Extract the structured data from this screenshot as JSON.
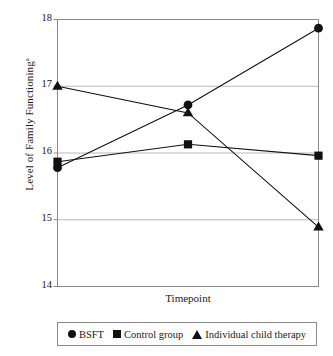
{
  "chart_data": {
    "type": "line",
    "title": "",
    "xlabel": "Timepoint",
    "ylabel": "Level of Family Functioning",
    "ylabel_superscript": "a",
    "categories": [
      "1",
      "2",
      "3"
    ],
    "x": [
      1,
      2,
      3
    ],
    "ylim": [
      14,
      18
    ],
    "yticks": [
      14,
      15,
      16,
      17,
      18
    ],
    "ytick_labels": [
      "14",
      "15",
      "16",
      "17",
      "18"
    ],
    "xticks": [],
    "xtick_labels": [],
    "grid": true,
    "grid_axis": "y",
    "legend_position": "below",
    "series": [
      {
        "name": "BSFT",
        "marker": "circle",
        "color": "#111111",
        "values": [
          15.78,
          16.72,
          17.87
        ]
      },
      {
        "name": "Control group",
        "marker": "square",
        "color": "#111111",
        "values": [
          15.87,
          16.13,
          15.96
        ]
      },
      {
        "name": "Individual child therapy",
        "marker": "triangle",
        "color": "#111111",
        "values": [
          17.0,
          16.6,
          14.89
        ]
      }
    ]
  },
  "axes": {
    "y_tick_18": "18",
    "y_tick_17": "17",
    "y_tick_16": "16",
    "y_tick_15": "15",
    "y_tick_14": "14",
    "x_axis_title": "Timepoint",
    "y_axis_title": "Level of Family Functioning",
    "y_axis_title_sup": "a"
  },
  "legend": {
    "items": [
      {
        "label": "BSFT",
        "marker": "circle-marker"
      },
      {
        "label": "Control group",
        "marker": "square-marker"
      },
      {
        "label": "Individual child therapy",
        "marker": "triangle-marker"
      }
    ]
  },
  "colors": {
    "series": "#111111",
    "gridline": "#b9b9b9",
    "frame": "#8a8a8a",
    "background": "#ffffff"
  }
}
